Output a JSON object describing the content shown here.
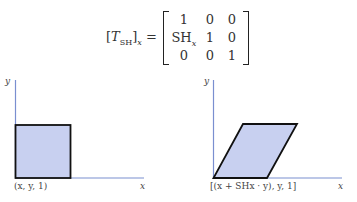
{
  "equation": {
    "lhs_open": "[",
    "lhs_symbol": "T",
    "lhs_subscript": "SH",
    "lhs_close": "]",
    "lhs_outer_subscript": "x",
    "equals": "=",
    "matrix": [
      [
        "1",
        "0",
        "0"
      ],
      [
        "SHx",
        "1",
        "0"
      ],
      [
        "0",
        "0",
        "1"
      ]
    ]
  },
  "left_figure": {
    "y_axis_label": "y",
    "x_axis_label": "x",
    "point_label": "(x,  y, 1)",
    "shape": "square",
    "fill_color": "#c8d0f0",
    "axis_color": "#7a8fd0"
  },
  "right_figure": {
    "y_axis_label": "y",
    "x_axis_label": "x",
    "point_label": "[(x + SHx · y), y, 1]",
    "shape": "parallelogram",
    "fill_color": "#c8d0f0",
    "axis_color": "#7a8fd0"
  }
}
